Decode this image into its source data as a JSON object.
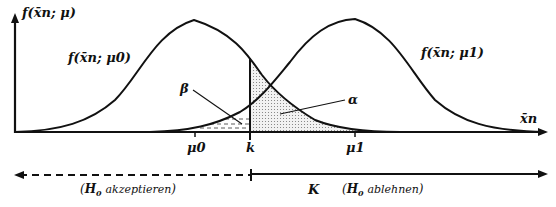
{
  "diagram": {
    "type": "hypothesis-test-error-regions",
    "y_axis_label": "f(x̄n; μ)",
    "x_axis_label": "x̄n",
    "curves": [
      {
        "name": "null",
        "label": "f(x̄n; μ0)",
        "mean_label": "μ0"
      },
      {
        "name": "alternative",
        "label": "f(x̄n; μ1)",
        "mean_label": "μ1"
      }
    ],
    "critical_value_label": "k",
    "areas": {
      "beta": "β",
      "alpha": "α"
    },
    "regions": {
      "accept": {
        "label": "(H0 akzeptieren)",
        "h": "H",
        "sub": "0",
        "text": "akzeptieren"
      },
      "reject": {
        "symbol": "K",
        "label": "(H0 ablehnen)",
        "h": "H",
        "sub": "0",
        "text": "ablehnen"
      }
    }
  }
}
